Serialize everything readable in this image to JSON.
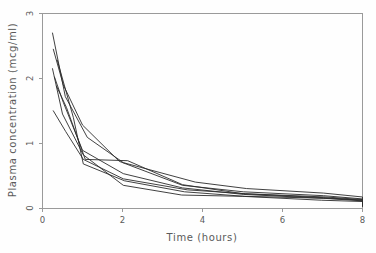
{
  "figure": {
    "background_color": "#fefefe",
    "axis_color": "#9a9a9a",
    "curve_color": "#2b2b2b",
    "text_color": "#5a5a5a"
  },
  "chart_data": {
    "type": "line",
    "title": "",
    "subtitle": "",
    "xlabel": "Time (hours)",
    "ylabel": "Plasma concentration (mcg/ml)",
    "xlim": [
      0,
      8
    ],
    "ylim": [
      0,
      3
    ],
    "xticks": [
      0,
      2,
      4,
      6,
      8
    ],
    "xticklabels": [
      "0",
      "2",
      "4",
      "6",
      "8"
    ],
    "yticks": [
      0,
      1,
      2,
      3
    ],
    "yticklabels": [
      "0",
      "1",
      "2",
      "3"
    ],
    "grid": false,
    "legend": null,
    "legend_position": "none",
    "annotations": [],
    "x": [
      0.25,
      0.57,
      1.12,
      2.02,
      3.82,
      5.1,
      7.03,
      9.05,
      12.12,
      24.37
    ],
    "series": [
      {
        "name": "subject-1",
        "x": [
          0.25,
          0.57,
          1.12,
          2.02,
          3.82,
          5.1,
          7.03,
          9.05,
          11.98,
          24.65
        ],
        "values": [
          2.7,
          1.72,
          1.09,
          0.7,
          0.4,
          0.3,
          0.23,
          0.17,
          0.11,
          0.04
        ]
      },
      {
        "name": "subject-2",
        "x": [
          0.27,
          0.52,
          1.0,
          1.92,
          3.5,
          5.02,
          7.03,
          9.0,
          12.0,
          24.3
        ],
        "values": [
          2.45,
          1.9,
          1.28,
          0.72,
          0.35,
          0.25,
          0.19,
          0.14,
          0.1,
          0.05
        ]
      },
      {
        "name": "subject-3",
        "x": [
          0.27,
          0.58,
          1.02,
          2.02,
          3.62,
          5.08,
          7.07,
          9.0,
          12.15,
          24.17
        ],
        "values": [
          1.5,
          1.18,
          0.75,
          0.45,
          0.28,
          0.22,
          0.17,
          0.13,
          0.09,
          0.04
        ]
      },
      {
        "name": "subject-4",
        "x": [
          0.35,
          0.6,
          1.07,
          2.13,
          3.5,
          5.02,
          7.02,
          9.02,
          11.98,
          24.65
        ],
        "values": [
          1.88,
          1.55,
          0.75,
          0.73,
          0.36,
          0.22,
          0.16,
          0.12,
          0.08,
          0.03
        ]
      },
      {
        "name": "subject-5",
        "x": [
          0.3,
          0.52,
          1.0,
          2.02,
          3.5,
          5.02,
          7.02,
          9.1,
          12.0,
          24.35
        ],
        "values": [
          2.02,
          1.63,
          0.89,
          0.53,
          0.31,
          0.21,
          0.15,
          0.11,
          0.07,
          0.03
        ]
      },
      {
        "name": "subject-6",
        "x": [
          0.37,
          0.77,
          1.02,
          2.05,
          3.55,
          5.05,
          7.08,
          9.38,
          12.1,
          23.7
        ],
        "values": [
          2.28,
          1.4,
          0.68,
          0.42,
          0.25,
          0.18,
          0.15,
          0.12,
          0.08,
          0.03
        ]
      },
      {
        "name": "subject-7",
        "x": [
          0.25,
          0.5,
          1.02,
          2.02,
          3.48,
          5.0,
          6.98,
          9.0,
          12.05,
          24.22
        ],
        "values": [
          2.15,
          1.45,
          0.82,
          0.35,
          0.2,
          0.18,
          0.12,
          0.1,
          0.07,
          0.03
        ]
      }
    ]
  }
}
